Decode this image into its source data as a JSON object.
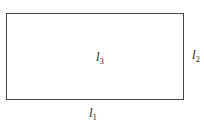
{
  "diagram": {
    "shape": "rectangle",
    "labels": {
      "l1": {
        "base": "l",
        "sub": "1",
        "position": "below bottom edge"
      },
      "l2": {
        "base": "l",
        "sub": "2",
        "position": "right of right edge"
      },
      "l3": {
        "base": "l",
        "sub": "3",
        "position": "center"
      }
    }
  }
}
